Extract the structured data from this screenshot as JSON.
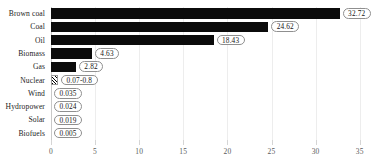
{
  "chart_data": {
    "type": "bar",
    "orientation": "horizontal",
    "title": "",
    "subtitle": "",
    "xlabel": "",
    "ylabel": "",
    "xlim": [
      0,
      36.05
    ],
    "grid": true,
    "legend": null,
    "xticks": [
      0,
      5,
      10,
      15,
      20,
      25,
      30,
      35
    ],
    "xtick_labels": [
      "0",
      "5",
      "10",
      "15",
      "20",
      "25",
      "30",
      "35"
    ],
    "categories": [
      "Brown coal",
      "Coal",
      "Oil",
      "Biomass",
      "Gas",
      "Nuclear",
      "Wind",
      "Hydropower",
      "Solar",
      "Biofuels"
    ],
    "values": [
      32.72,
      24.62,
      18.43,
      4.63,
      2.82,
      0.8,
      0.035,
      0.024,
      0.019,
      0.005
    ],
    "value_labels": [
      "32.72",
      "24.62",
      "18.43",
      "4.63",
      "2.82",
      "0.07-0.8",
      "0.035",
      "0.024",
      "0.019",
      "0.005"
    ],
    "bar_styles": [
      "solid",
      "solid",
      "solid",
      "solid",
      "solid",
      "hatched",
      "solid",
      "solid",
      "solid",
      "solid"
    ],
    "colors": {
      "bar": "#0b0b0b",
      "grid": "#ededed",
      "axis": "#c9c9c9",
      "pill_border": "#8f8f8f",
      "text": "#1c1c1c",
      "tick_text": "#5b5b5b"
    }
  }
}
